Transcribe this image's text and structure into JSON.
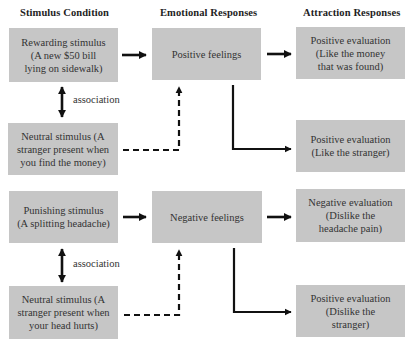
{
  "headers": {
    "stimulus": "Stimulus Condition",
    "emotional": "Emotional Responses",
    "attraction": "Attraction Responses"
  },
  "top": {
    "stimulus": "Rewarding stimulus\n(A new $50 bill\nlying on sidewalk)",
    "neutral": "Neutral stimulus (A\nstranger present when\nyou find the money)",
    "emotion": "Positive feelings",
    "eval_stimulus": "Positive evaluation\n(Like the money\nthat was found)",
    "eval_neutral": "Positive evaluation\n(Like the stranger)",
    "association": "association"
  },
  "bottom": {
    "stimulus": "Punishing stimulus\n(A splitting headache)",
    "neutral": "Neutral stimulus (A\nstranger present when\nyour head hurts)",
    "emotion": "Negative feelings",
    "eval_stimulus": "Negative evaluation\n(Dislike the\nheadache pain)",
    "eval_neutral": "Positive evaluation\n(Dislike the\nstranger)",
    "association": "association"
  },
  "colors": {
    "box_fill": "#c6c6c6",
    "arrow": "#111111"
  }
}
